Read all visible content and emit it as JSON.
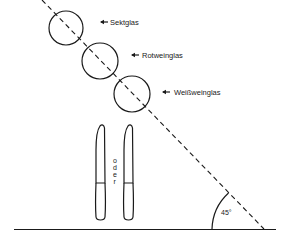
{
  "figure": {
    "angle_label": "45°",
    "glasses": [
      {
        "label": "Sektglas",
        "cx": 66,
        "cy": 28,
        "r": 17,
        "arrow_x": 100,
        "text_x": 110,
        "text_y": 25
      },
      {
        "label": "Rotweinglas",
        "cx": 100,
        "cy": 61,
        "r": 18,
        "arrow_x": 131,
        "text_x": 142,
        "text_y": 58
      },
      {
        "label": "Weißweinglas",
        "cx": 132,
        "cy": 94,
        "r": 18,
        "arrow_x": 162,
        "text_x": 174,
        "text_y": 95
      }
    ],
    "knives": [
      {
        "name": "knife-left",
        "x": 95,
        "width": 11
      },
      {
        "name": "knife-right",
        "x": 123,
        "width": 11
      }
    ],
    "oder_text": [
      "o",
      "d",
      "e",
      "r"
    ],
    "diagonal": {
      "x1": 42,
      "y1": 0,
      "x2": 264,
      "y2": 229
    },
    "baseline": {
      "x1": 14,
      "y1": 229,
      "x2": 276,
      "y2": 229
    }
  }
}
